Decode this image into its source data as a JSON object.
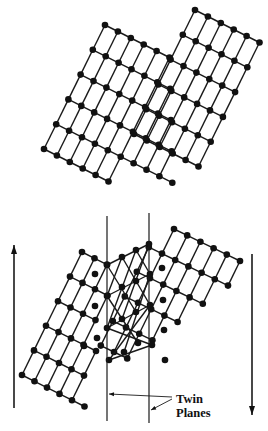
{
  "figure": {
    "top_panel": {
      "description": "Perfect crystal lattice before twinning",
      "blocks": [
        {
          "origin": [
            105,
            25
          ],
          "a": [
            12.9,
            6.5
          ],
          "b": [
            -12.2,
            24.8
          ],
          "rows": [
            [
              0,
              5
            ],
            [
              0,
              6
            ],
            [
              0,
              7
            ],
            [
              0,
              8
            ],
            [
              0,
              9
            ],
            [
              0,
              5
            ]
          ]
        },
        {
          "origin": [
            195,
            10
          ],
          "a": [
            12.9,
            6.5
          ],
          "b": [
            -12.2,
            24.8
          ],
          "rows": [
            [
              0,
              5
            ],
            [
              0,
              5
            ],
            [
              0,
              5
            ],
            [
              0,
              5
            ],
            [
              0,
              5
            ],
            [
              0,
              5
            ]
          ]
        }
      ]
    },
    "bottom_panel": {
      "description": "Twinned lattice with mirrored middle region",
      "grains": [
        {
          "name": "left-grain",
          "origin": [
            82,
            252
          ],
          "a": [
            12.5,
            6.3
          ],
          "b": [
            -12.0,
            24.6
          ],
          "rows": [
            [
              0,
              2
            ],
            [
              0,
              3
            ],
            [
              0,
              3
            ],
            [
              0,
              4
            ],
            [
              0,
              4
            ],
            [
              0,
              5
            ]
          ]
        },
        {
          "name": "right-grain",
          "origin": [
            174,
            229
          ],
          "a": [
            13.2,
            6.4
          ],
          "b": [
            -12.0,
            24.6
          ],
          "rows": [
            [
              0,
              5
            ],
            [
              -1,
              5
            ],
            [
              -1,
              4
            ],
            [
              -1,
              3
            ],
            [
              -1,
              2
            ],
            [
              -1,
              1
            ]
          ]
        }
      ],
      "twin_zone_atoms": [
        [
          107,
          265
        ],
        [
          122,
          257
        ],
        [
          136,
          250
        ],
        [
          149,
          244
        ],
        [
          107,
          296
        ],
        [
          122,
          287
        ],
        [
          136,
          281
        ],
        [
          150,
          274
        ],
        [
          107,
          328
        ],
        [
          122,
          319
        ],
        [
          136,
          312
        ],
        [
          150,
          305
        ],
        [
          109,
          360
        ],
        [
          124,
          352
        ],
        [
          138,
          343
        ],
        [
          152,
          345
        ],
        [
          95,
          274
        ],
        [
          95,
          306
        ],
        [
          97,
          338
        ],
        [
          84,
          346
        ],
        [
          162,
          268
        ],
        [
          163,
          300
        ],
        [
          164,
          330
        ],
        [
          165,
          360
        ]
      ],
      "twin_zone_bonds": [
        [
          [
            107,
            265
          ],
          [
            149,
            244
          ]
        ],
        [
          [
            107,
            296
          ],
          [
            150,
            274
          ]
        ],
        [
          [
            107,
            328
          ],
          [
            150,
            305
          ]
        ],
        [
          [
            109,
            360
          ],
          [
            152,
            345
          ]
        ],
        [
          [
            107,
            265
          ],
          [
            136,
            312
          ]
        ],
        [
          [
            107,
            296
          ],
          [
            138,
            343
          ]
        ],
        [
          [
            107,
            328
          ],
          [
            152,
            345
          ]
        ],
        [
          [
            149,
            244
          ],
          [
            122,
            319
          ]
        ],
        [
          [
            150,
            274
          ],
          [
            124,
            352
          ]
        ],
        [
          [
            150,
            305
          ],
          [
            109,
            360
          ]
        ],
        [
          [
            122,
            257
          ],
          [
            150,
            305
          ]
        ],
        [
          [
            136,
            250
          ],
          [
            150,
            274
          ]
        ],
        [
          [
            122,
            257
          ],
          [
            107,
            296
          ]
        ],
        [
          [
            136,
            250
          ],
          [
            107,
            328
          ]
        ]
      ],
      "twin_planes": [
        {
          "x": 107,
          "y1": 216,
          "y2": 421
        },
        {
          "x": 149,
          "y1": 213,
          "y2": 423
        }
      ],
      "shear_arrows": [
        {
          "name": "left-arrow-up",
          "x": 14,
          "y_tail": 408,
          "y_tip": 245,
          "direction": "up"
        },
        {
          "name": "right-arrow-down",
          "x": 252,
          "y_tail": 254,
          "y_tip": 415,
          "direction": "down"
        }
      ],
      "label": {
        "line1": "Twin",
        "line2": "Planes"
      },
      "leaders": [
        {
          "from": [
            172,
            397
          ],
          "to": [
            109,
            394
          ]
        },
        {
          "from": [
            172,
            399
          ],
          "to": [
            151,
            410
          ]
        }
      ]
    },
    "colors": {
      "ink": "#111111",
      "background": "#ffffff"
    }
  }
}
